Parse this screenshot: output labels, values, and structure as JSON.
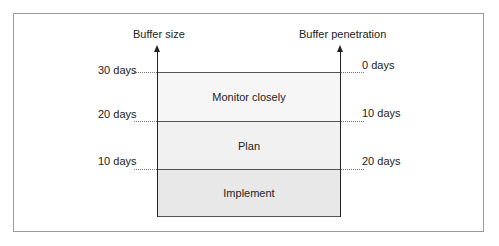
{
  "diagram": {
    "left_axis": {
      "title": "Buffer size",
      "ticks": [
        "30 days",
        "20 days",
        "10 days"
      ]
    },
    "right_axis": {
      "title": "Buffer penetration",
      "ticks": [
        "0 days",
        "10 days",
        "20 days"
      ]
    },
    "zones": [
      {
        "label": "Monitor closely",
        "color": "#f6f6f6"
      },
      {
        "label": "Plan",
        "color": "#f1f1f1"
      },
      {
        "label": "Implement",
        "color": "#e8e8e8"
      }
    ]
  }
}
